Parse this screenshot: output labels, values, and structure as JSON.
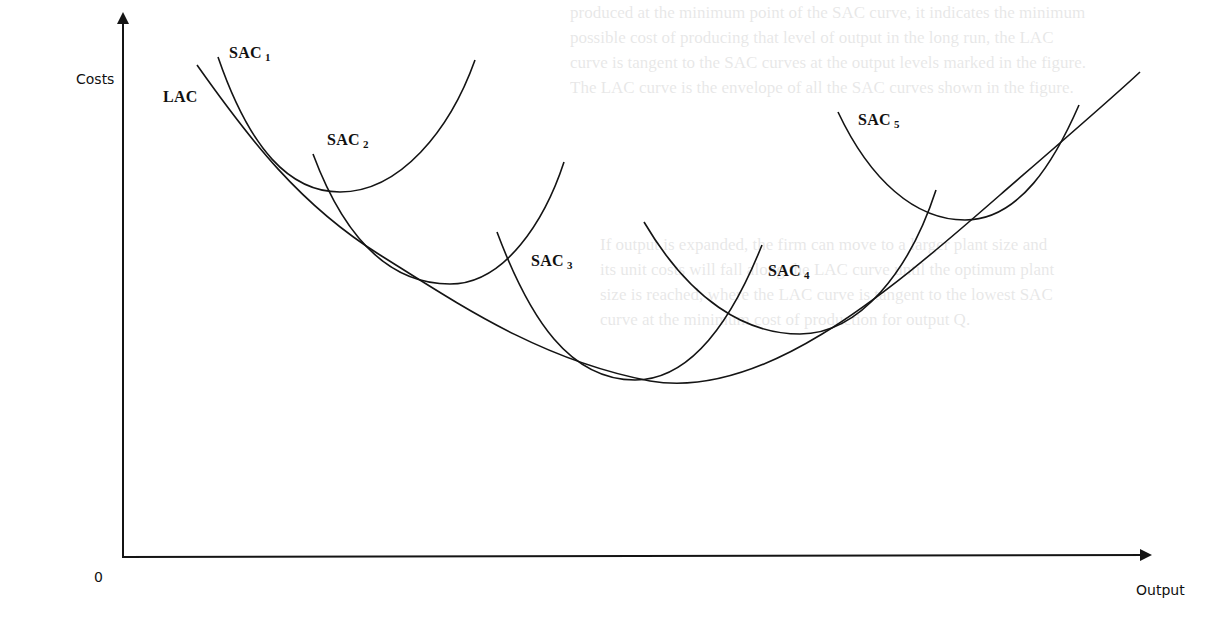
{
  "diagram": {
    "type": "economics-cost-curves",
    "axes": {
      "y_label": "Costs",
      "x_label": "Output",
      "origin_label": "0"
    },
    "curves": [
      {
        "id": "LAC",
        "label": "LAC",
        "subscript": "",
        "role": "long-run average cost envelope"
      },
      {
        "id": "SAC1",
        "label": "SAC",
        "subscript": "1",
        "role": "short-run average cost"
      },
      {
        "id": "SAC2",
        "label": "SAC",
        "subscript": "2",
        "role": "short-run average cost"
      },
      {
        "id": "SAC3",
        "label": "SAC",
        "subscript": "3",
        "role": "short-run average cost"
      },
      {
        "id": "SAC4",
        "label": "SAC",
        "subscript": "4",
        "role": "short-run average cost"
      },
      {
        "id": "SAC5",
        "label": "SAC",
        "subscript": "5",
        "role": "short-run average cost"
      }
    ],
    "colors": {
      "ink": "#141414",
      "background": "#ffffff"
    }
  },
  "background_bleed_text": {
    "top_lines": [
      "produced at the minimum point of the SAC curve, it indicates the minimum",
      "possible cost of producing that level of output in the long run, the LAC",
      "curve is tangent to the SAC curves at the output levels marked in the figure.",
      "The LAC curve is the envelope of all the SAC curves shown in the figure."
    ],
    "middle_lines": [
      "If output is expanded, the firm can move to a larger plant size and",
      "its unit costs will fall along the LAC curve until the optimum plant",
      "size is reached, where the LAC curve is tangent to the lowest SAC",
      "curve at the minimum cost of production for output Q."
    ]
  }
}
